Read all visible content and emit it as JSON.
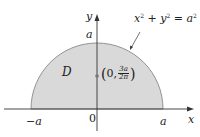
{
  "diagram": {
    "colors": {
      "region_fill": "#d9d9d9",
      "curve": "#8a8a8a",
      "axes": "#333333",
      "point": "#777777",
      "text": "#222222"
    },
    "region_label": "D",
    "curve_label": {
      "x": "x",
      "plus": " + ",
      "y": "y",
      "equals": " = ",
      "a": "a",
      "exponent": "2"
    },
    "axes": {
      "x_label": "x",
      "y_label": "y",
      "origin_label": "0"
    },
    "ticks": {
      "neg_a": "−a",
      "pos_a": "a",
      "top_a": "a"
    },
    "centroid": {
      "open": "(",
      "x": "0,",
      "num": "3a",
      "den": "2π",
      "close": ")"
    }
  }
}
